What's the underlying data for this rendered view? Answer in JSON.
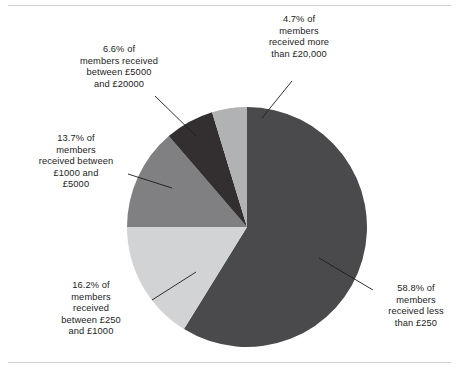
{
  "figure": {
    "background_color": "#ffffff",
    "rule_color": "#cfcfcf",
    "text_color": "#1c1c1c"
  },
  "chart_data": {
    "type": "pie",
    "title": "",
    "subtitle": "",
    "xlabel": "",
    "ylabel": "",
    "legend_position": "none",
    "grid": false,
    "start_angle_deg": 0,
    "direction": "clockwise",
    "center": {
      "x": 247,
      "y": 227
    },
    "radius": 120,
    "categories": [
      "less than £250",
      "between £250 and £1000",
      "between £1000 and £5000",
      "between £5000 and £20000",
      "more than £20,000"
    ],
    "values": [
      58.8,
      16.2,
      13.7,
      6.6,
      4.7
    ],
    "units": "percent of members",
    "colors": [
      "#4a4a4c",
      "#d2d3d4",
      "#808082",
      "#332f30",
      "#b0b2b4"
    ],
    "slices": [
      {
        "name": "less-than-250",
        "percent": 58.8,
        "color": "#4a4a4c",
        "label": "58.8% of\nmembers\nreceived less\nthan £250"
      },
      {
        "name": "between-250-and-1000",
        "percent": 16.2,
        "color": "#d2d3d4",
        "label": "16.2% of\nmembers\nreceived\nbetween £250\nand £1000"
      },
      {
        "name": "between-1000-and-5000",
        "percent": 13.7,
        "color": "#808082",
        "label": "13.7% of\nmembers\nreceived between\n£1000 and\n£5000"
      },
      {
        "name": "between-5000-and-20000",
        "percent": 6.6,
        "color": "#332f30",
        "label": "6.6% of\nmembers received\nbetween £5000\nand £20000"
      },
      {
        "name": "more-than-20000",
        "percent": 4.7,
        "color": "#b0b2b4",
        "label": "4.7% of\nmembers\nreceived more\nthan £20,000"
      }
    ]
  }
}
